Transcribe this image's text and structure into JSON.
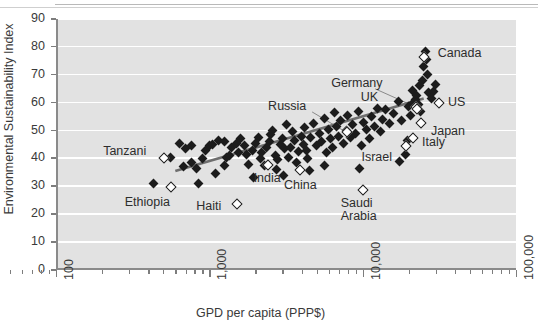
{
  "chart_data": {
    "type": "scatter",
    "title": "",
    "xlabel": "GPD per capita (PPP$)",
    "ylabel": "Environmental Sustainability Index",
    "xscale": "log",
    "xlim": [
      100,
      100000
    ],
    "ylim": [
      0,
      90
    ],
    "xticks": [
      "100",
      "1,000",
      "10,000",
      "100,000"
    ],
    "yticks": [
      "0",
      "10",
      "20",
      "30",
      "40",
      "50",
      "60",
      "70",
      "80",
      "90"
    ],
    "grid": "horizontal-white",
    "legend": "none",
    "trendline": {
      "type": "linear-fit-on-log-x",
      "visible": true,
      "color": "#6e6e6e",
      "x_start": 600,
      "y_start": 35.5,
      "x_end": 25000,
      "y_end": 61.5
    },
    "annotations": [
      {
        "label": "Tanzani",
        "x": 500,
        "y": 40.5,
        "marker": "open"
      },
      {
        "label": "Ethiopia",
        "x": 560,
        "y": 30.0,
        "marker": "open"
      },
      {
        "label": "Haiti",
        "x": 1500,
        "y": 24.0,
        "marker": "open"
      },
      {
        "label": "India",
        "x": 2400,
        "y": 38.0,
        "marker": "open"
      },
      {
        "label": "China",
        "x": 3900,
        "y": 36.0,
        "marker": "open"
      },
      {
        "label": "Russia",
        "x": 7800,
        "y": 49.5,
        "marker": "open"
      },
      {
        "label": "Saudi Arabia",
        "x": 10000,
        "y": 29.0,
        "marker": "open"
      },
      {
        "label": "Israel",
        "x": 19000,
        "y": 44.5,
        "marker": "open"
      },
      {
        "label": "Italy",
        "x": 21000,
        "y": 47.5,
        "marker": "open"
      },
      {
        "label": "Japan",
        "x": 24000,
        "y": 53.0,
        "marker": "open"
      },
      {
        "label": "Germany",
        "x": 22000,
        "y": 58.5,
        "marker": "open"
      },
      {
        "label": "UK",
        "x": 22500,
        "y": 58.0,
        "marker": "open"
      },
      {
        "label": "US",
        "x": 31000,
        "y": 60.0,
        "marker": "open"
      },
      {
        "label": "Canada",
        "x": 25000,
        "y": 76.5,
        "marker": "open"
      }
    ],
    "points_filled": [
      [
        430,
        31.0
      ],
      [
        560,
        40.5
      ],
      [
        640,
        45.5
      ],
      [
        700,
        43.5
      ],
      [
        760,
        44.5
      ],
      [
        820,
        36.5
      ],
      [
        850,
        31.0
      ],
      [
        900,
        40.0
      ],
      [
        950,
        43.0
      ],
      [
        1000,
        44.5
      ],
      [
        1050,
        45.0
      ],
      [
        1100,
        34.5
      ],
      [
        1150,
        46.5
      ],
      [
        1250,
        46.0
      ],
      [
        1300,
        40.5
      ],
      [
        1350,
        41.0
      ],
      [
        1400,
        44.0
      ],
      [
        1500,
        45.5
      ],
      [
        1550,
        42.0
      ],
      [
        1600,
        47.0
      ],
      [
        1700,
        44.5
      ],
      [
        1750,
        41.5
      ],
      [
        1800,
        38.0
      ],
      [
        1900,
        43.0
      ],
      [
        2000,
        45.5
      ],
      [
        2100,
        47.5
      ],
      [
        2150,
        40.0
      ],
      [
        2200,
        42.0
      ],
      [
        2300,
        37.5
      ],
      [
        2350,
        44.0
      ],
      [
        2450,
        46.0
      ],
      [
        2500,
        48.5
      ],
      [
        2600,
        50.0
      ],
      [
        2700,
        41.0
      ],
      [
        2800,
        39.5
      ],
      [
        2900,
        45.0
      ],
      [
        3000,
        47.0
      ],
      [
        3100,
        43.5
      ],
      [
        3200,
        52.0
      ],
      [
        3300,
        40.5
      ],
      [
        3400,
        44.0
      ],
      [
        3500,
        49.5
      ],
      [
        3600,
        46.5
      ],
      [
        3700,
        38.5
      ],
      [
        3800,
        42.5
      ],
      [
        4000,
        48.0
      ],
      [
        4100,
        45.0
      ],
      [
        4200,
        51.0
      ],
      [
        4300,
        43.0
      ],
      [
        4400,
        40.0
      ],
      [
        4600,
        47.5
      ],
      [
        4800,
        52.5
      ],
      [
        5000,
        44.5
      ],
      [
        5200,
        49.0
      ],
      [
        5400,
        46.0
      ],
      [
        5600,
        54.5
      ],
      [
        5800,
        42.0
      ],
      [
        6000,
        50.5
      ],
      [
        6200,
        47.0
      ],
      [
        6400,
        44.0
      ],
      [
        6600,
        56.5
      ],
      [
        6800,
        51.5
      ],
      [
        7000,
        48.0
      ],
      [
        7200,
        53.5
      ],
      [
        7500,
        45.5
      ],
      [
        7800,
        50.0
      ],
      [
        8000,
        55.5
      ],
      [
        8300,
        47.5
      ],
      [
        8600,
        52.0
      ],
      [
        9000,
        49.0
      ],
      [
        9400,
        57.0
      ],
      [
        9800,
        44.5
      ],
      [
        10200,
        53.0
      ],
      [
        10600,
        50.5
      ],
      [
        11000,
        47.0
      ],
      [
        11500,
        55.0
      ],
      [
        12000,
        51.5
      ],
      [
        12500,
        58.0
      ],
      [
        13000,
        49.5
      ],
      [
        13500,
        54.0
      ],
      [
        14000,
        57.5
      ],
      [
        15000,
        52.5
      ],
      [
        16000,
        56.0
      ],
      [
        17000,
        60.5
      ],
      [
        18000,
        53.5
      ],
      [
        19000,
        41.5
      ],
      [
        19500,
        46.5
      ],
      [
        20000,
        58.5
      ],
      [
        20500,
        55.5
      ],
      [
        21000,
        64.5
      ],
      [
        21500,
        60.0
      ],
      [
        22000,
        61.0
      ],
      [
        22500,
        62.5
      ],
      [
        23000,
        59.5
      ],
      [
        23500,
        66.0
      ],
      [
        24000,
        57.0
      ],
      [
        24500,
        68.0
      ],
      [
        25000,
        73.0
      ],
      [
        25500,
        78.5
      ],
      [
        26000,
        75.5
      ],
      [
        26500,
        70.0
      ],
      [
        27000,
        63.5
      ],
      [
        28000,
        61.5
      ],
      [
        29000,
        64.0
      ],
      [
        30000,
        66.5
      ],
      [
        17500,
        39.0
      ],
      [
        9500,
        36.5
      ],
      [
        4500,
        35.5
      ],
      [
        3050,
        34.0
      ],
      [
        1950,
        33.0
      ],
      [
        760,
        38.5
      ],
      [
        680,
        37.0
      ],
      [
        1250,
        37.5
      ],
      [
        2750,
        36.0
      ],
      [
        5600,
        37.5
      ]
    ]
  }
}
